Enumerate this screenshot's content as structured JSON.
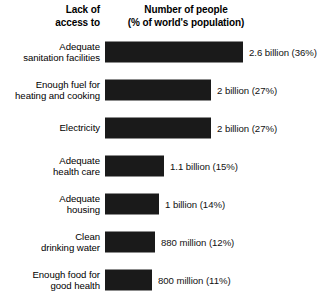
{
  "chart_data": {
    "type": "bar",
    "orientation": "horizontal",
    "title": "",
    "xlabel": "",
    "ylabel": "",
    "grid": false,
    "legend": null,
    "axis_headers": {
      "category_header_lines": [
        "Lack of",
        "access to"
      ],
      "value_header_lines": [
        "Number of people",
        "(% of world's population)"
      ]
    },
    "xlim": [
      0,
      36
    ],
    "unit": "percent of world's population",
    "bar_color": "#1a1a1a",
    "background_color": "#ffffff",
    "categories": [
      "Adequate sanitation facilities",
      "Enough fuel for heating and cooking",
      "Electricity",
      "Adequate health care",
      "Adequate housing",
      "Clean drinking water",
      "Enough food for good health"
    ],
    "values": [
      36,
      27,
      27,
      15,
      14,
      12,
      11
    ],
    "counts": [
      2600000000,
      2000000000,
      2000000000,
      1100000000,
      1000000000,
      880000000,
      800000000
    ],
    "data_labels": [
      "2.6 billion (36%)",
      "2 billion (27%)",
      "2 billion (27%)",
      "1.1 billion (15%)",
      "1 billion (14%)",
      "880 million (12%)",
      "800 million (11%)"
    ],
    "rows": [
      {
        "category_lines": [
          "Adequate",
          "sanitation facilities"
        ],
        "value_label": "2.6 billion (36%)",
        "percent": 36,
        "bar_px": 138
      },
      {
        "category_lines": [
          "Enough fuel for",
          "heating and cooking"
        ],
        "value_label": "2 billion (27%)",
        "percent": 27,
        "bar_px": 106
      },
      {
        "category_lines": [
          "Electricity"
        ],
        "value_label": "2 billion (27%)",
        "percent": 27,
        "bar_px": 106
      },
      {
        "category_lines": [
          "Adequate",
          "health care"
        ],
        "value_label": "1.1 billion (15%)",
        "percent": 15,
        "bar_px": 59
      },
      {
        "category_lines": [
          "Adequate",
          "housing"
        ],
        "value_label": "1 billion (14%)",
        "percent": 14,
        "bar_px": 54
      },
      {
        "category_lines": [
          "Clean",
          "drinking water"
        ],
        "value_label": "880 million (12%)",
        "percent": 12,
        "bar_px": 50
      },
      {
        "category_lines": [
          "Enough food for",
          "good health"
        ],
        "value_label": "800 million (11%)",
        "percent": 11,
        "bar_px": 47
      }
    ]
  }
}
